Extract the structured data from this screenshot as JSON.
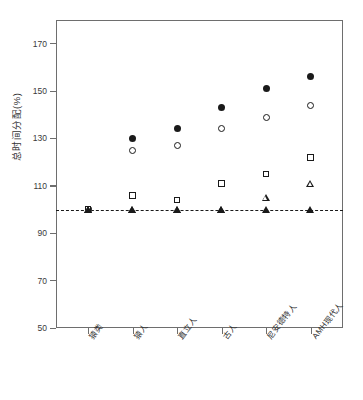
{
  "chart_data": {
    "type": "scatter",
    "title": "",
    "xlabel": "",
    "ylabel": "总时间分配(%)",
    "ylim": [
      50,
      180
    ],
    "yticks": [
      70,
      90,
      110,
      130,
      150,
      170
    ],
    "grid": false,
    "legend": "none",
    "categories": [
      "猿类",
      "猿人",
      "直立人",
      "古人",
      "尼安德特人",
      "AMH现代人"
    ],
    "reference_line": {
      "value": 100,
      "style": "dashed",
      "color": "#1a1a1a"
    },
    "series": [
      {
        "name": "filled-circle",
        "marker": "filled-circle",
        "values": [
          100,
          130,
          134,
          143,
          151,
          156
        ]
      },
      {
        "name": "open-circle",
        "marker": "open-circle",
        "values": [
          100,
          125,
          127,
          134,
          139,
          144
        ]
      },
      {
        "name": "open-square",
        "marker": "open-square",
        "values": [
          100,
          106,
          104,
          111,
          115,
          122
        ]
      },
      {
        "name": "open-triangle",
        "marker": "open-triangle",
        "values": [
          100,
          100,
          100,
          100,
          105,
          111
        ]
      },
      {
        "name": "filled-triangle",
        "marker": "filled-triangle",
        "values": [
          100,
          100,
          100,
          100,
          100,
          100
        ]
      }
    ]
  },
  "axis": {
    "y_title": "总时间分配(%)",
    "y_tick_labels": [
      "170",
      "150",
      "130",
      "110",
      "90",
      "70",
      "50"
    ],
    "x_tick_labels": [
      "猿类",
      "猿人",
      "直立人",
      "古人",
      "尼安德特人",
      "AMH现代人"
    ]
  }
}
